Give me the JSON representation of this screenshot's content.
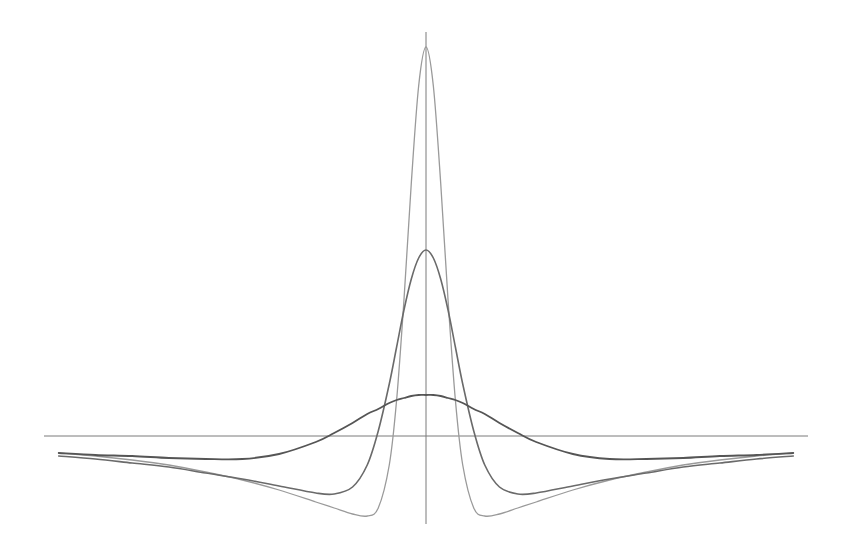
{
  "chart_data": {
    "type": "line",
    "title": "",
    "xlabel": "",
    "ylabel": "",
    "grid": false,
    "legend": "none",
    "xlim": [
      -1.04,
      1.04
    ],
    "ylim": [
      -0.88,
      4.04
    ],
    "x": [
      -1.0,
      -0.9,
      -0.8,
      -0.7,
      -0.6,
      -0.5,
      -0.4,
      -0.3,
      -0.25,
      -0.2,
      -0.16,
      -0.13,
      -0.1,
      -0.08,
      -0.06,
      -0.04,
      -0.02,
      0,
      0.02,
      0.04,
      0.06,
      0.08,
      0.1,
      0.13,
      0.16,
      0.2,
      0.25,
      0.3,
      0.4,
      0.5,
      0.6,
      0.7,
      0.8,
      0.9,
      1.0
    ],
    "series": [
      {
        "name": "narrow",
        "color": "#9a9a9a",
        "values": [
          -0.17,
          -0.2,
          -0.24,
          -0.29,
          -0.36,
          -0.44,
          -0.54,
          -0.66,
          -0.72,
          -0.78,
          -0.8,
          -0.72,
          -0.29,
          0.36,
          1.36,
          2.53,
          3.5,
          3.89,
          3.5,
          2.53,
          1.36,
          0.36,
          -0.29,
          -0.72,
          -0.8,
          -0.78,
          -0.72,
          -0.66,
          -0.54,
          -0.44,
          -0.36,
          -0.29,
          -0.24,
          -0.2,
          -0.17
        ]
      },
      {
        "name": "medium",
        "color": "#6a6a6a",
        "values": [
          -0.2,
          -0.23,
          -0.27,
          -0.31,
          -0.37,
          -0.43,
          -0.5,
          -0.57,
          -0.58,
          -0.51,
          -0.29,
          0.05,
          0.52,
          0.89,
          1.26,
          1.57,
          1.78,
          1.86,
          1.78,
          1.57,
          1.26,
          0.89,
          0.52,
          0.05,
          -0.29,
          -0.51,
          -0.58,
          -0.57,
          -0.5,
          -0.43,
          -0.37,
          -0.31,
          -0.27,
          -0.23,
          -0.2
        ]
      },
      {
        "name": "wide",
        "color": "#555555",
        "values": [
          -0.17,
          -0.19,
          -0.2,
          -0.22,
          -0.23,
          -0.23,
          -0.18,
          -0.06,
          0.03,
          0.13,
          0.22,
          0.27,
          0.33,
          0.36,
          0.38,
          0.4,
          0.41,
          0.41,
          0.41,
          0.4,
          0.38,
          0.36,
          0.33,
          0.27,
          0.22,
          0.13,
          0.03,
          -0.06,
          -0.18,
          -0.23,
          -0.23,
          -0.22,
          -0.2,
          -0.19,
          -0.17
        ]
      }
    ]
  }
}
